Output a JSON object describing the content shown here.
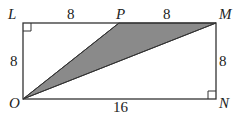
{
  "diagram": {
    "type": "geometry",
    "shape": "rectangle LMNO with shaded triangle OPM",
    "colors": {
      "stroke": "#333333",
      "shade": "#8a8a8a",
      "background": "#ffffff"
    },
    "vertices": {
      "L": {
        "label": "L"
      },
      "P": {
        "label": "P"
      },
      "M": {
        "label": "M"
      },
      "N": {
        "label": "N"
      },
      "O": {
        "label": "O"
      }
    },
    "measurements": {
      "LP": "8",
      "PM": "8",
      "LO": "8",
      "MN": "8",
      "ON": "16"
    },
    "right_angles": [
      "L",
      "N"
    ],
    "shaded_region": "triangle OPM"
  }
}
